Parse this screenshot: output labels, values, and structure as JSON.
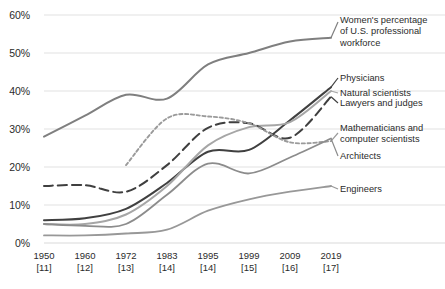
{
  "chart_data": {
    "type": "line",
    "title": "",
    "subtitle": "",
    "xlabel": "",
    "ylabel": "",
    "grid": true,
    "legend_position": "right-inline",
    "ylim": [
      0,
      60
    ],
    "yticks": [
      0,
      10,
      20,
      30,
      40,
      50,
      60
    ],
    "ytick_labels": [
      "0%",
      "10%",
      "20%",
      "30%",
      "40%",
      "50%",
      "60%"
    ],
    "x": [
      "1950",
      "1960",
      "1972",
      "1983",
      "1995",
      "1999",
      "2009",
      "2019"
    ],
    "x_references": [
      "[11]",
      "[12]",
      "[13]",
      "[14]",
      "[14]",
      "[15]",
      "[16]",
      "[17]"
    ],
    "xtick_labels": [
      {
        "year": "1950",
        "ref": "[11]"
      },
      {
        "year": "1960",
        "ref": "[12]"
      },
      {
        "year": "1972",
        "ref": "[13]"
      },
      {
        "year": "1983",
        "ref": "[14]"
      },
      {
        "year": "1995",
        "ref": "[14]"
      },
      {
        "year": "1999",
        "ref": "[15]"
      },
      {
        "year": "2009",
        "ref": "[16]"
      },
      {
        "year": "2019",
        "ref": "[17]"
      }
    ],
    "series": [
      {
        "name": "Women's percentage of U.S. professional workforce",
        "label_lines": "Women's percentage\nof U.S. professional\nworkforce",
        "color": "#7f7f7f",
        "dash": "none",
        "width": 2.0,
        "values": [
          28,
          33.5,
          39,
          38,
          47,
          50,
          53,
          54
        ]
      },
      {
        "name": "Physicians",
        "label_lines": "Physicians",
        "color": "#404040",
        "dash": "none",
        "width": 2.0,
        "values": [
          6,
          6.5,
          9,
          15.8,
          24,
          24.5,
          32.3,
          41
        ]
      },
      {
        "name": "Natural scientists",
        "label_lines": "Natural scientists",
        "color": "#a6a6a6",
        "dash": "none",
        "width": 2.0,
        "values": [
          5,
          5,
          7.5,
          15,
          25.7,
          30.5,
          31.8,
          40
        ]
      },
      {
        "name": "Lawyers and judges",
        "label_lines": "Lawyers and judges",
        "color": "#3f3f3f",
        "dash": "long",
        "width": 2.0,
        "values": [
          15,
          15.2,
          13.5,
          20.5,
          30.3,
          31.5,
          27.7,
          38.5
        ]
      },
      {
        "name": "Mathematicians and computer scientists",
        "label_lines": "Mathematicians and\ncomputer scientists",
        "color": "#9a9a9a",
        "dash": "short",
        "width": 1.9,
        "values": [
          null,
          null,
          20.5,
          32.8,
          33.3,
          31.5,
          26.5,
          26.8
        ]
      },
      {
        "name": "Architects",
        "label_lines": "Architects",
        "color": "#8c8c8c",
        "dash": "none",
        "width": 1.8,
        "values": [
          5,
          4.5,
          5,
          12.7,
          20.9,
          18.3,
          22.5,
          27.5
        ]
      },
      {
        "name": "Engineers",
        "label_lines": "Engineers",
        "color": "#989898",
        "dash": "none",
        "width": 1.8,
        "values": [
          2,
          2,
          2.5,
          3.5,
          8.5,
          11.5,
          13.5,
          15
        ]
      }
    ],
    "colors": {
      "grid": "#d9d9d9",
      "text": "#262626",
      "background": "#ffffff"
    }
  },
  "axis": {
    "y_ticks": [
      "60%",
      "50%",
      "40%",
      "30%",
      "20%",
      "10%",
      "0%"
    ]
  },
  "annotations": {
    "women": "Women's percentage\nof U.S. professional\nworkforce",
    "physicians": "Physicians",
    "natural_scientists": "Natural scientists",
    "lawyers": "Lawyers and judges",
    "math": "Mathematicians and\ncomputer scientists",
    "architects": "Architects",
    "engineers": "Engineers"
  }
}
